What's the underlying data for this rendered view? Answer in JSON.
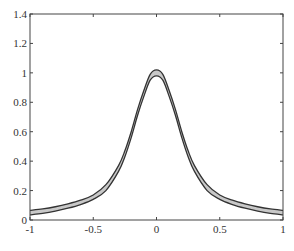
{
  "chart_data": {
    "type": "area",
    "title": "",
    "xlabel": "",
    "ylabel": "",
    "xlim": [
      -1,
      1
    ],
    "ylim": [
      0,
      1.4
    ],
    "grid": false,
    "legend": null,
    "x_ticks": [
      -1,
      -0.5,
      0,
      0.5,
      1
    ],
    "x_tick_labels": [
      "-1",
      "-0.5",
      "0",
      "0.5",
      "1"
    ],
    "y_ticks": [
      0,
      0.2,
      0.4,
      0.6,
      0.8,
      1,
      1.2,
      1.4
    ],
    "y_tick_labels": [
      "0",
      "0.2",
      "0.4",
      "0.6",
      "0.8",
      "1",
      "1.2",
      "1.4"
    ],
    "series": [
      {
        "name": "upper bound",
        "x": [
          -1,
          -0.9,
          -0.8,
          -0.7,
          -0.6,
          -0.5,
          -0.4,
          -0.3,
          -0.25,
          -0.2,
          -0.15,
          -0.1,
          -0.05,
          0,
          0.05,
          0.1,
          0.15,
          0.2,
          0.25,
          0.3,
          0.4,
          0.5,
          0.6,
          0.7,
          0.8,
          0.9,
          1
        ],
        "values": [
          0.065,
          0.075,
          0.09,
          0.11,
          0.135,
          0.17,
          0.24,
          0.37,
          0.47,
          0.6,
          0.75,
          0.88,
          0.99,
          1.02,
          0.99,
          0.88,
          0.75,
          0.6,
          0.47,
          0.37,
          0.24,
          0.17,
          0.135,
          0.11,
          0.09,
          0.075,
          0.065
        ]
      },
      {
        "name": "lower bound",
        "x": [
          -1,
          -0.9,
          -0.8,
          -0.7,
          -0.6,
          -0.5,
          -0.4,
          -0.3,
          -0.25,
          -0.2,
          -0.15,
          -0.1,
          -0.05,
          0,
          0.05,
          0.1,
          0.15,
          0.2,
          0.25,
          0.3,
          0.4,
          0.5,
          0.6,
          0.7,
          0.8,
          0.9,
          1
        ],
        "values": [
          0.035,
          0.045,
          0.06,
          0.08,
          0.105,
          0.14,
          0.2,
          0.33,
          0.43,
          0.56,
          0.71,
          0.84,
          0.95,
          0.98,
          0.95,
          0.84,
          0.71,
          0.56,
          0.43,
          0.33,
          0.2,
          0.14,
          0.105,
          0.08,
          0.06,
          0.045,
          0.035
        ]
      }
    ],
    "fill_color": "#c8c8c8",
    "line_color": "#333333"
  }
}
